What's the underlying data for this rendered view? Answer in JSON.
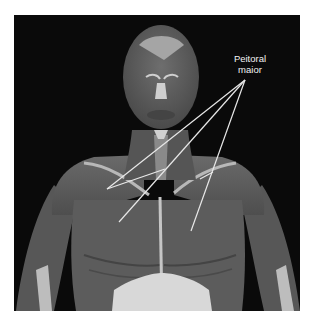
{
  "figure": {
    "label": {
      "line1": "Peitoral",
      "line2": "maior"
    },
    "colors": {
      "background": "#0a0a0a",
      "frame": "#ffffff",
      "label_text": "#f2f2f2",
      "pointer_lines": "#e8e8e8"
    }
  }
}
